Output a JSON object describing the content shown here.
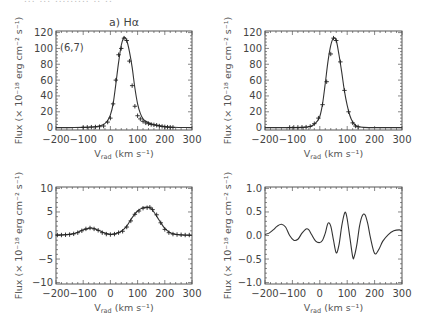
{
  "header_fragment": "... ... ......... .. ..",
  "chart_data": [
    {
      "id": "top-left",
      "type": "line",
      "title": "a) Hα",
      "annotation": "(6,7)",
      "xlabel": "V_rad (km s⁻¹)",
      "ylabel": "Flux (× 10⁻¹⁸ erg cm⁻² s⁻¹)",
      "xlim": [
        -200,
        300
      ],
      "ylim": [
        -3,
        122
      ],
      "xticks": [
        -200,
        -100,
        0,
        100,
        200,
        300
      ],
      "yticks": [
        0,
        20,
        40,
        60,
        80,
        100,
        120
      ],
      "series": [
        {
          "name": "model",
          "style": "line",
          "x": [
            -200,
            -150,
            -100,
            -75,
            -50,
            -25,
            -10,
            0,
            10,
            20,
            30,
            40,
            50,
            60,
            70,
            80,
            90,
            100,
            110,
            120,
            130,
            150,
            170,
            200,
            230,
            260,
            300
          ],
          "y": [
            0,
            0,
            0.3,
            0.7,
            1.5,
            4,
            9,
            16,
            30,
            55,
            82,
            104,
            114,
            110,
            96,
            76,
            50,
            30,
            18,
            11,
            8,
            5,
            3,
            1.5,
            0.5,
            0.2,
            0
          ]
        },
        {
          "name": "observed",
          "style": "plus",
          "x": [
            -100,
            -85,
            -70,
            -55,
            -40,
            -25,
            -10,
            0,
            10,
            20,
            30,
            40,
            50,
            60,
            70,
            80,
            90,
            100,
            110,
            120,
            130,
            140,
            150,
            160,
            170,
            180,
            190,
            200,
            210,
            220,
            230
          ],
          "y": [
            0.3,
            0.4,
            0.6,
            0.8,
            1.2,
            2,
            7,
            12,
            30,
            60,
            92,
            100,
            113,
            110,
            84,
            53,
            27,
            15,
            11,
            8,
            6,
            5,
            4,
            3.5,
            3,
            2,
            1.5,
            1,
            0.6,
            0.4,
            0.3
          ]
        }
      ]
    },
    {
      "id": "top-right",
      "type": "line",
      "title": "",
      "xlabel": "V_rad (km s⁻¹)",
      "ylabel": "Flux (× 10⁻¹⁸ erg cm⁻² s⁻¹)",
      "xlim": [
        -200,
        300
      ],
      "ylim": [
        -3,
        122
      ],
      "xticks": [
        -200,
        -100,
        0,
        100,
        200,
        300
      ],
      "yticks": [
        0,
        20,
        40,
        60,
        80,
        100,
        120
      ],
      "series": [
        {
          "name": "model",
          "style": "line",
          "x": [
            -200,
            -100,
            -60,
            -40,
            -25,
            -10,
            0,
            10,
            20,
            30,
            40,
            50,
            60,
            70,
            80,
            90,
            100,
            110,
            120,
            130,
            140,
            160,
            200,
            300
          ],
          "y": [
            0,
            0,
            0.3,
            1,
            3,
            8,
            14,
            30,
            56,
            84,
            104,
            113,
            110,
            92,
            70,
            46,
            28,
            15,
            7,
            3,
            1,
            0.3,
            0,
            0
          ]
        },
        {
          "name": "observed",
          "style": "plus",
          "x": [
            -110,
            -95,
            -80,
            -65,
            -50,
            -35,
            -20,
            -5,
            10,
            25,
            40,
            50,
            60,
            75,
            90,
            105,
            120,
            130,
            140
          ],
          "y": [
            0.2,
            0.2,
            0.3,
            0.4,
            0.6,
            1.5,
            5,
            12,
            29,
            58,
            93,
            113,
            110,
            83,
            47,
            20,
            6,
            2,
            1
          ]
        }
      ]
    },
    {
      "id": "bottom-left",
      "type": "line",
      "title": "",
      "xlabel": "V_rad (km s⁻¹)",
      "ylabel": "Flux (× 10⁻¹⁸ erg cm⁻² s⁻¹)",
      "xlim": [
        -200,
        300
      ],
      "ylim": [
        -10.3,
        10.3
      ],
      "xticks": [
        -200,
        -100,
        0,
        100,
        200,
        300
      ],
      "yticks": [
        -10,
        -5,
        0,
        5,
        10
      ],
      "series": [
        {
          "name": "model",
          "style": "line",
          "x": [
            -200,
            -170,
            -140,
            -120,
            -100,
            -80,
            -70,
            -60,
            -40,
            -20,
            0,
            20,
            40,
            60,
            80,
            100,
            120,
            140,
            150,
            160,
            180,
            200,
            220,
            240,
            260,
            300
          ],
          "y": [
            0.1,
            0.15,
            0.35,
            0.7,
            1.2,
            1.5,
            1.6,
            1.5,
            1.0,
            0.5,
            0.25,
            0.4,
            0.9,
            2,
            3.8,
            5.2,
            5.9,
            6.0,
            5.7,
            5.0,
            3.2,
            1.5,
            0.6,
            0.25,
            0.1,
            0.05
          ]
        },
        {
          "name": "observed",
          "style": "plus",
          "x": [
            -195,
            -180,
            -165,
            -150,
            -135,
            -120,
            -105,
            -90,
            -75,
            -60,
            -45,
            -30,
            -15,
            0,
            15,
            30,
            45,
            60,
            75,
            90,
            105,
            120,
            135,
            145,
            155,
            170,
            185,
            200,
            215,
            230,
            245,
            260,
            275,
            290
          ],
          "y": [
            0.1,
            0.1,
            0.15,
            0.2,
            0.35,
            0.6,
            1,
            1.4,
            1.6,
            1.4,
            1.1,
            0.6,
            0.3,
            0.2,
            0.3,
            0.6,
            0.9,
            1.8,
            3.1,
            4.5,
            5.2,
            5.8,
            5.9,
            6,
            5.5,
            4.4,
            2.7,
            1.3,
            0.6,
            0.3,
            0.2,
            0.15,
            0.1,
            0.1
          ]
        }
      ]
    },
    {
      "id": "bottom-right",
      "type": "line",
      "title": "",
      "xlabel": "V_rad (km s⁻¹)",
      "ylabel": "Flux (× 10⁻¹⁸ erg cm⁻² s⁻¹)",
      "xlim": [
        -200,
        300
      ],
      "ylim": [
        -1.03,
        1.03
      ],
      "xticks": [
        -200,
        -100,
        0,
        100,
        200,
        300
      ],
      "yticks": [
        -1.0,
        -0.5,
        0.0,
        0.5,
        1.0
      ],
      "series": [
        {
          "name": "residual",
          "style": "line",
          "x": [
            -200,
            -185,
            -170,
            -155,
            -140,
            -125,
            -110,
            -95,
            -80,
            -65,
            -50,
            -40,
            -30,
            -15,
            0,
            10,
            20,
            30,
            40,
            50,
            60,
            70,
            80,
            90,
            95,
            100,
            110,
            120,
            125,
            135,
            145,
            155,
            165,
            175,
            185,
            200,
            215,
            230,
            250,
            270,
            290,
            300
          ],
          "y": [
            0.02,
            0.05,
            0.12,
            0.2,
            0.24,
            0.18,
            0.0,
            -0.1,
            -0.08,
            0.05,
            0.14,
            0.12,
            0.02,
            -0.12,
            -0.15,
            -0.1,
            0.05,
            0.26,
            0.2,
            -0.1,
            -0.37,
            -0.2,
            0.2,
            0.47,
            0.48,
            0.35,
            -0.05,
            -0.45,
            -0.46,
            -0.2,
            0.2,
            0.42,
            0.44,
            0.25,
            -0.05,
            -0.38,
            -0.3,
            -0.12,
            0.02,
            0.1,
            0.12,
            0.1
          ]
        }
      ]
    }
  ]
}
